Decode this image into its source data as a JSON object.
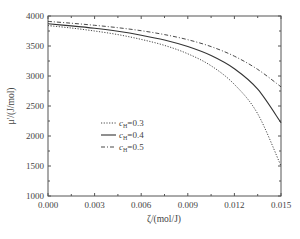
{
  "chart_data": {
    "type": "line",
    "title": "",
    "xlabel": "ζ/(mol/J)",
    "ylabel": "μ'/(J/mol)",
    "xlim": [
      0.0,
      0.015
    ],
    "ylim": [
      1000,
      4000
    ],
    "x_ticks": [
      "0.000",
      "0.003",
      "0.006",
      "0.009",
      "0.012",
      "0.015"
    ],
    "y_ticks": [
      "1000",
      "1500",
      "2000",
      "2500",
      "3000",
      "3500",
      "4000"
    ],
    "grid": false,
    "legend_position": "lower-left (inside)",
    "x": [
      0.0,
      0.0015,
      0.003,
      0.0045,
      0.006,
      0.0075,
      0.009,
      0.0105,
      0.012,
      0.0135,
      0.015
    ],
    "series": [
      {
        "name": "c_H=0.3",
        "style": "dotted",
        "values": [
          3840,
          3800,
          3750,
          3690,
          3610,
          3510,
          3370,
          3170,
          2860,
          2370,
          1500
        ]
      },
      {
        "name": "c_H=0.4",
        "style": "solid",
        "values": [
          3870,
          3835,
          3795,
          3745,
          3680,
          3600,
          3490,
          3340,
          3120,
          2780,
          2220
        ]
      },
      {
        "name": "c_H=0.5",
        "style": "dash-dot",
        "values": [
          3910,
          3880,
          3845,
          3805,
          3755,
          3690,
          3605,
          3490,
          3330,
          3110,
          2820
        ]
      }
    ]
  },
  "legend": [
    {
      "prefix": "c",
      "sub": "H",
      "suffix": "=0.3"
    },
    {
      "prefix": "c",
      "sub": "H",
      "suffix": "=0.4"
    },
    {
      "prefix": "c",
      "sub": "H",
      "suffix": "=0.5"
    }
  ],
  "labels": {
    "xlabel": "ζ/(mol/J)",
    "ylabel": "μ'/(J/mol)"
  }
}
